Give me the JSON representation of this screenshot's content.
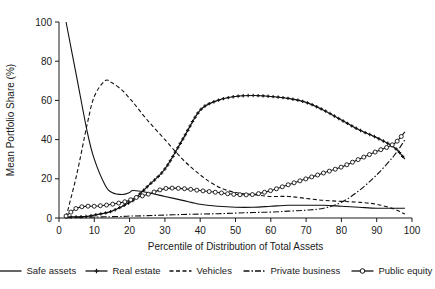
{
  "chart_data": {
    "type": "line",
    "title": "",
    "xlabel": "Percentile of Distribution of Total Assets",
    "ylabel": "Mean Portfolio Share (%)",
    "xlim": [
      0,
      100
    ],
    "ylim": [
      0,
      100
    ],
    "xticks": [
      0,
      10,
      20,
      30,
      40,
      50,
      60,
      70,
      80,
      90,
      100
    ],
    "yticks": [
      0,
      20,
      40,
      60,
      80,
      100
    ],
    "grid": false,
    "legend_position": "bottom",
    "x": [
      2,
      5,
      8,
      10,
      13,
      15,
      18,
      20,
      21,
      25,
      30,
      35,
      40,
      45,
      50,
      55,
      60,
      65,
      70,
      75,
      80,
      85,
      90,
      95,
      98
    ],
    "series": [
      {
        "name": "Safe assets",
        "style": "solid",
        "marker": "none",
        "values": [
          100,
          72,
          44,
          30,
          17,
          13,
          12,
          13,
          14,
          13,
          11,
          9,
          7,
          6,
          5.5,
          5.5,
          6,
          6.5,
          6.5,
          6.5,
          6,
          5.5,
          5,
          5,
          5
        ]
      },
      {
        "name": "Real estate",
        "style": "solid",
        "marker": "plus",
        "values": [
          0.5,
          0.6,
          0.8,
          1.5,
          2.5,
          3.5,
          6,
          8,
          9,
          16,
          25,
          40,
          55,
          60,
          62,
          62.5,
          62,
          61,
          59,
          55,
          50,
          45,
          41,
          36,
          30
        ]
      },
      {
        "name": "Vehicles",
        "style": "dotted",
        "marker": "none",
        "values": [
          0.5,
          22,
          48,
          62,
          70,
          69,
          65,
          61,
          59,
          50,
          40,
          30,
          22,
          16,
          13,
          12,
          11,
          11,
          10,
          9,
          8.5,
          8,
          7,
          4.5,
          2
        ]
      },
      {
        "name": "Private business",
        "style": "dashdot",
        "marker": "none",
        "values": [
          0.2,
          0.3,
          0.4,
          0.5,
          0.6,
          0.7,
          0.8,
          1,
          1,
          1.2,
          1.5,
          1.8,
          2,
          2.2,
          2.5,
          2.8,
          3,
          3.5,
          4,
          5,
          8,
          14,
          22,
          32,
          40
        ]
      },
      {
        "name": "Public equity",
        "style": "solid",
        "marker": "circle",
        "values": [
          1,
          5,
          6,
          6,
          6.5,
          7,
          8,
          9,
          10,
          12,
          15,
          15,
          14,
          13,
          12,
          12,
          14,
          17,
          20,
          23,
          26,
          30,
          34,
          38,
          44
        ]
      }
    ]
  },
  "legend": {
    "items": [
      {
        "label": "Safe assets",
        "style": "solid",
        "marker": "none"
      },
      {
        "label": "Real estate",
        "style": "solid",
        "marker": "plus"
      },
      {
        "label": "Vehicles",
        "style": "dotted",
        "marker": "none"
      },
      {
        "label": "Private business",
        "style": "dashdot",
        "marker": "none"
      },
      {
        "label": "Public equity",
        "style": "solid",
        "marker": "circle"
      }
    ]
  }
}
